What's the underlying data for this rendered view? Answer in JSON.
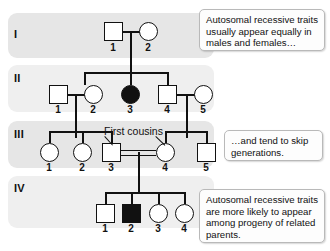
{
  "figure": {
    "symbol_colors": {
      "affected": "#111111",
      "unaffected": "#ffffff",
      "stroke": "#111111"
    },
    "band_colors": {
      "odd": "#e6e6e6",
      "even": "#efefef"
    }
  },
  "generations": [
    {
      "label": "I"
    },
    {
      "label": "II"
    },
    {
      "label": "III"
    },
    {
      "label": "IV"
    }
  ],
  "individuals": {
    "g1": [
      {
        "id": "I-1",
        "number": "1",
        "sex": "male",
        "affected": false
      },
      {
        "id": "I-2",
        "number": "2",
        "sex": "female",
        "affected": false
      }
    ],
    "g2": [
      {
        "id": "II-1",
        "number": "1",
        "sex": "male",
        "affected": false
      },
      {
        "id": "II-2",
        "number": "2",
        "sex": "female",
        "affected": false
      },
      {
        "id": "II-3",
        "number": "3",
        "sex": "female",
        "affected": true
      },
      {
        "id": "II-4",
        "number": "4",
        "sex": "male",
        "affected": false
      },
      {
        "id": "II-5",
        "number": "5",
        "sex": "female",
        "affected": false
      }
    ],
    "g3": [
      {
        "id": "III-1",
        "number": "1",
        "sex": "female",
        "affected": false
      },
      {
        "id": "III-2",
        "number": "2",
        "sex": "female",
        "affected": false
      },
      {
        "id": "III-3",
        "number": "3",
        "sex": "male",
        "affected": false
      },
      {
        "id": "III-4",
        "number": "4",
        "sex": "female",
        "affected": false
      },
      {
        "id": "III-5",
        "number": "5",
        "sex": "male",
        "affected": false
      }
    ],
    "g4": [
      {
        "id": "IV-1",
        "number": "1",
        "sex": "male",
        "affected": false
      },
      {
        "id": "IV-2",
        "number": "2",
        "sex": "male",
        "affected": true
      },
      {
        "id": "IV-3",
        "number": "3",
        "sex": "female",
        "affected": false
      },
      {
        "id": "IV-4",
        "number": "4",
        "sex": "female",
        "affected": false
      }
    ]
  },
  "annotations": {
    "consanguinity_label": "First cousins"
  },
  "callouts": [
    {
      "id": "callout-1",
      "text": "Autosomal recessive traits usually appear equally in males and females…"
    },
    {
      "id": "callout-2",
      "text": "…and tend to skip generations."
    },
    {
      "id": "callout-3",
      "text": "Autosomal recessive traits are more likely to appear among progeny of related parents."
    }
  ]
}
